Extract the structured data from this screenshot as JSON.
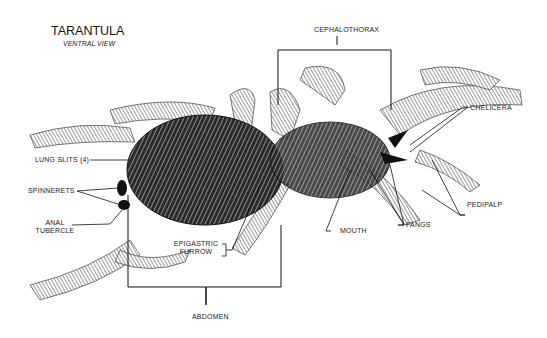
{
  "diagram": {
    "title": "TARANTULA",
    "subtitle": "VENTRAL VIEW",
    "labels": {
      "cephalothorax": "CEPHALOTHORAX",
      "chelicera": "CHELICERA",
      "lung_slits": "LUNG SLITS (4)",
      "spinnerets": "SPINNERETS",
      "anal_tubercle_line1": "ANAL",
      "anal_tubercle_line2": "TUBERCLE",
      "fangs": "FANGS",
      "pedipalp": "PEDIPALP",
      "mouth": "MOUTH",
      "epigastric_line1": "EPIGASTRIC",
      "epigastric_line2": "FURROW",
      "abdomen": "ABDOMEN"
    },
    "colors": {
      "ink": "#111111",
      "background": "#ffffff"
    }
  }
}
